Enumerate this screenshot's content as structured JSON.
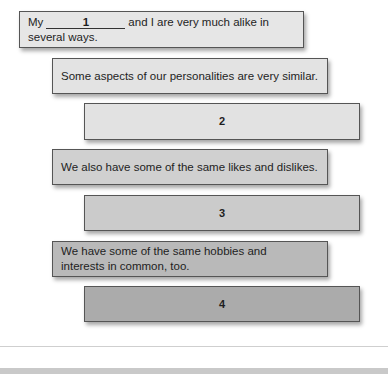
{
  "diagram": {
    "boxes": [
      {
        "type": "text",
        "prefix": "My",
        "blank_number": "1",
        "suffix": "and I are very much alike in several ways.",
        "fill": "#e6e6e6"
      },
      {
        "type": "text",
        "text": "Some aspects of our personalities are very similar.",
        "fill": "#e3e3e3"
      },
      {
        "type": "number",
        "text": "2",
        "fill": "#e2e2e2"
      },
      {
        "type": "text",
        "text": "We also have some of the same likes and dislikes.",
        "fill": "#d0d0d0"
      },
      {
        "type": "number",
        "text": "3",
        "fill": "#cbcbcb"
      },
      {
        "type": "text",
        "text": "We have some of the same hobbies and interests in common, too.",
        "fill": "#b9b9b9"
      },
      {
        "type": "number",
        "text": "4",
        "fill": "#ababab"
      }
    ]
  }
}
